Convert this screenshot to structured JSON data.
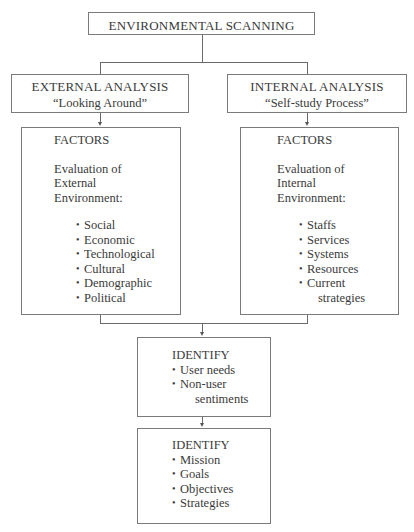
{
  "root": {
    "label": "ENVIRONMENTAL SCANNING"
  },
  "external": {
    "title": "EXTERNAL ANALYSIS",
    "subtitle": "“Looking Around”",
    "factors": {
      "heading": "FACTORS",
      "eval_line1": "Evaluation of",
      "eval_line2": "External",
      "eval_line3": "Environment:",
      "items": [
        "Social",
        "Economic",
        "Technological",
        "Cultural",
        "Demographic",
        "Political"
      ]
    }
  },
  "internal": {
    "title": "INTERNAL ANALYSIS",
    "subtitle": "“Self-study Process”",
    "factors": {
      "heading": "FACTORS",
      "eval_line1": "Evaluation of",
      "eval_line2": "Internal",
      "eval_line3": "Environment:",
      "items": [
        "Staffs",
        "Services",
        "Systems",
        "Resources",
        "Current"
      ],
      "item_continuation": "strategies"
    }
  },
  "identify1": {
    "heading": "IDENTIFY",
    "items": [
      "User needs",
      "Non-user"
    ],
    "item_continuation": "sentiments"
  },
  "identify2": {
    "heading": "IDENTIFY",
    "items": [
      "Mission",
      "Goals",
      "Objectives",
      "Strategies"
    ]
  }
}
